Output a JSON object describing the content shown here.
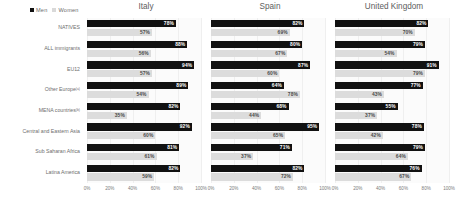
{
  "legend": {
    "items": [
      {
        "label": "Men",
        "color": "#111111",
        "icon": "square-marker-icon"
      },
      {
        "label": "Women",
        "color": "#d9d9d9",
        "icon": "square-marker-icon"
      }
    ]
  },
  "chart_data": {
    "type": "bar",
    "title": "",
    "xlabel": "",
    "ylabel": "",
    "xlim": [
      0,
      100
    ],
    "grid": true,
    "legend_position": "top-left",
    "orientation": "horizontal",
    "value_suffix": "%",
    "tick_labels": [
      "0%",
      "20%",
      "40%",
      "60%",
      "80%",
      "100%"
    ],
    "ticks": [
      0,
      20,
      40,
      60,
      80,
      100
    ],
    "categories": [
      "NATIVES",
      "ALL immigrants",
      "EU12",
      "Other Europe",
      "MENA countries",
      "Central and Eastern Asia",
      "Sub Saharan Africa",
      "Latina America"
    ],
    "category_footnotes": [
      "",
      "",
      "",
      "(a)",
      "(b)",
      "",
      "",
      ""
    ],
    "panels": [
      {
        "title": "Italy",
        "series": [
          {
            "name": "Men",
            "values": [
              78,
              88,
              94,
              89,
              82,
              92,
              81,
              82
            ]
          },
          {
            "name": "Women",
            "values": [
              57,
              56,
              57,
              54,
              35,
              60,
              61,
              59
            ]
          }
        ]
      },
      {
        "title": "Spain",
        "series": [
          {
            "name": "Men",
            "values": [
              82,
              80,
              87,
              64,
              68,
              95,
              71,
              82
            ]
          },
          {
            "name": "Women",
            "values": [
              69,
              67,
              60,
              78,
              44,
              65,
              37,
              72
            ]
          }
        ]
      },
      {
        "title": "United Kingdom",
        "series": [
          {
            "name": "Men",
            "values": [
              82,
              79,
              91,
              77,
              55,
              78,
              79,
              76
            ]
          },
          {
            "name": "Women",
            "values": [
              70,
              54,
              79,
              43,
              37,
              42,
              64,
              67
            ]
          }
        ]
      }
    ]
  }
}
